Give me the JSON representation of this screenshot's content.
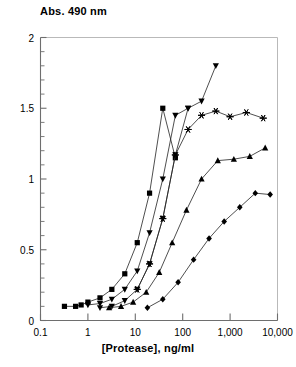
{
  "chart_data": {
    "type": "line",
    "title": "Abs. 490 nm",
    "xlabel": "[Protease], ng/ml",
    "ylabel": "Abs. 490 nm",
    "xscale": "log",
    "xlim": [
      0.1,
      10000
    ],
    "ylim": [
      0,
      2
    ],
    "grid": false,
    "legend": "none",
    "x_tick_labels": [
      "0.1",
      "1",
      "10",
      "100",
      "1,000",
      "10,000"
    ],
    "x_tick_values": [
      0.1,
      1,
      10,
      100,
      1000,
      10000
    ],
    "y_tick_labels": [
      "0",
      "0.5",
      "1",
      "1.5",
      "2"
    ],
    "y_tick_values": [
      0,
      0.5,
      1,
      1.5,
      2
    ],
    "y_minor_step": 0.1,
    "line_color": "#222222",
    "marker_color": "#000000",
    "series": [
      {
        "name": "Series 1",
        "marker": "square",
        "x": [
          0.32,
          0.55,
          0.72,
          1.0,
          1.8,
          3.2,
          6.0,
          11.0,
          20.0,
          38.0,
          70.0
        ],
        "y": [
          0.1,
          0.1,
          0.11,
          0.13,
          0.16,
          0.22,
          0.33,
          0.55,
          0.9,
          1.5,
          1.15
        ]
      },
      {
        "name": "Series 2",
        "marker": "down-triangle",
        "x": [
          1.0,
          1.8,
          3.2,
          6.0,
          11.0,
          20.0,
          38.0,
          70.0,
          130.0,
          250.0,
          500.0
        ],
        "y": [
          0.11,
          0.12,
          0.15,
          0.22,
          0.35,
          0.62,
          1.0,
          1.45,
          1.5,
          1.55,
          1.8
        ]
      },
      {
        "name": "Series 3",
        "marker": "down-triangle-2",
        "x": [
          1.8,
          3.2,
          6.0,
          11.0,
          20.0,
          38.0,
          70.0,
          130.0
        ],
        "y": [
          0.09,
          0.1,
          0.14,
          0.22,
          0.4,
          0.72,
          1.17,
          1.5
        ]
      },
      {
        "name": "Series 4",
        "marker": "star",
        "x": [
          11.0,
          20.0,
          38.0,
          70.0,
          130.0,
          250.0,
          500.0,
          1000.0,
          2200.0,
          5000.0
        ],
        "y": [
          0.22,
          0.4,
          0.72,
          1.17,
          1.35,
          1.45,
          1.48,
          1.44,
          1.47,
          1.43
        ]
      },
      {
        "name": "Series 5",
        "marker": "up-triangle",
        "x": [
          2.8,
          5.0,
          9.0,
          17.0,
          32.0,
          60.0,
          120.0,
          250.0,
          550.0,
          1200.0,
          2600.0,
          5500.0
        ],
        "y": [
          0.09,
          0.1,
          0.13,
          0.2,
          0.34,
          0.55,
          0.78,
          1.0,
          1.13,
          1.14,
          1.16,
          1.22
        ]
      },
      {
        "name": "Series 6",
        "marker": "diamond",
        "x": [
          18.0,
          38.0,
          80.0,
          170.0,
          360.0,
          750.0,
          1600.0,
          3400.0,
          7000.0
        ],
        "y": [
          0.09,
          0.15,
          0.27,
          0.43,
          0.58,
          0.7,
          0.8,
          0.9,
          0.89
        ]
      }
    ]
  }
}
